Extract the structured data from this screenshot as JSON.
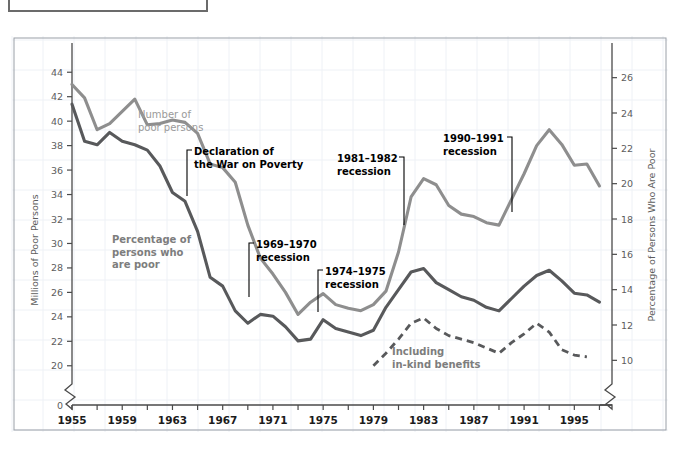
{
  "figure": {
    "cut_off_box_label": "",
    "background_color": "#ffffff",
    "grid_color": "#eef1f6",
    "frame_color": "#9aa0a8"
  },
  "axes": {
    "left": {
      "title": "Millions of Poor Persons",
      "tick_labels": [
        "0",
        "20",
        "22",
        "24",
        "26",
        "28",
        "30",
        "32",
        "34",
        "36",
        "38",
        "40",
        "42",
        "44"
      ],
      "has_break": true,
      "break_symbol": "zigzag"
    },
    "right": {
      "title": "Percentage of Persons Who Are Poor",
      "tick_labels": [
        "10",
        "12",
        "14",
        "16",
        "18",
        "20",
        "22",
        "24",
        "26"
      ],
      "has_break": true,
      "break_symbol": "zigzag"
    },
    "bottom": {
      "tick_labels": [
        "1955",
        "1959",
        "1963",
        "1967",
        "1971",
        "1975",
        "1979",
        "1983",
        "1987",
        "1991",
        "1995"
      ],
      "minor_tick_step_years": 2
    }
  },
  "annotations": [
    {
      "id": "number-of-poor-persons",
      "text_lines": [
        "Number of",
        "poor persons"
      ],
      "style": "gray-light",
      "has_leader": false
    },
    {
      "id": "percentage-who-are-poor",
      "text_lines": [
        "Percentage of",
        "persons who",
        "are poor"
      ],
      "style": "gray-dark",
      "has_leader": false
    },
    {
      "id": "declaration-war-on-poverty",
      "text_lines": [
        "Declaration of",
        "the War on Poverty"
      ],
      "style": "bold",
      "has_leader": true,
      "leader_side": "left"
    },
    {
      "id": "recession-1969-1970",
      "text_lines": [
        "1969–1970",
        "recession"
      ],
      "style": "bold",
      "has_leader": true,
      "leader_side": "left"
    },
    {
      "id": "recession-1974-1975",
      "text_lines": [
        "1974–1975",
        "recession"
      ],
      "style": "bold",
      "has_leader": true,
      "leader_side": "left"
    },
    {
      "id": "recession-1981-1982",
      "text_lines": [
        "1981–1982",
        "recession"
      ],
      "style": "bold",
      "has_leader": true,
      "leader_side": "right"
    },
    {
      "id": "recession-1990-1991",
      "text_lines": [
        "1990–1991",
        "recession"
      ],
      "style": "bold",
      "has_leader": true,
      "leader_side": "right"
    },
    {
      "id": "including-in-kind-benefits",
      "text_lines": [
        "Including",
        "in-kind benefits"
      ],
      "style": "inkind",
      "has_leader": false
    }
  ],
  "chart_data": {
    "type": "line",
    "title": "",
    "subtitle": "",
    "xlabel": "",
    "ylabel": "Millions of Poor Persons",
    "y2label": "Percentage of Persons Who Are Poor",
    "grid": true,
    "legend": "inline-annotations",
    "xlim": [
      1955,
      1998
    ],
    "ylim": [
      19.0,
      45.0
    ],
    "y2lim": [
      9.0,
      27.0
    ],
    "x": [
      1955,
      1956,
      1957,
      1958,
      1959,
      1960,
      1961,
      1962,
      1963,
      1964,
      1965,
      1966,
      1967,
      1968,
      1969,
      1970,
      1971,
      1972,
      1973,
      1974,
      1975,
      1976,
      1977,
      1978,
      1979,
      1980,
      1981,
      1982,
      1983,
      1984,
      1985,
      1986,
      1987,
      1988,
      1989,
      1990,
      1991,
      1992,
      1993,
      1994,
      1995,
      1996,
      1997
    ],
    "series": [
      {
        "name": "Number of poor persons",
        "unit": "millions",
        "axis": "left",
        "color": "#8e8e8e",
        "style": "solid",
        "values": [
          43.0,
          41.9,
          39.3,
          39.8,
          40.8,
          41.8,
          39.7,
          39.8,
          40.1,
          39.9,
          39.0,
          36.5,
          36.2,
          35.0,
          31.5,
          28.8,
          27.5,
          26.0,
          24.2,
          25.2,
          25.9,
          25.0,
          24.7,
          24.5,
          25.0,
          26.1,
          29.3,
          33.8,
          35.3,
          34.8,
          33.1,
          32.4,
          32.2,
          31.7,
          31.5,
          33.6,
          35.7,
          38.0,
          39.3,
          38.1,
          36.4,
          36.5,
          34.7
        ]
      },
      {
        "name": "Percentage of persons who are poor",
        "unit": "percent",
        "axis": "right",
        "color": "#58595b",
        "style": "solid",
        "values": [
          24.5,
          22.4,
          22.2,
          22.9,
          22.4,
          22.2,
          21.9,
          21.0,
          19.5,
          19.0,
          17.3,
          14.7,
          14.2,
          12.8,
          12.1,
          12.6,
          12.5,
          11.9,
          11.1,
          11.2,
          12.3,
          11.8,
          11.6,
          11.4,
          11.7,
          13.0,
          14.0,
          15.0,
          15.2,
          14.4,
          14.0,
          13.6,
          13.4,
          13.0,
          12.8,
          13.5,
          14.2,
          14.8,
          15.1,
          14.5,
          13.8,
          13.7,
          13.3
        ]
      },
      {
        "name": "Including in-kind benefits",
        "unit": "percent",
        "axis": "right",
        "color": "#58595b",
        "style": "dashed",
        "x": [
          1979,
          1980,
          1981,
          1982,
          1983,
          1984,
          1985,
          1986,
          1987,
          1988,
          1989,
          1990,
          1991,
          1992,
          1993,
          1994,
          1995,
          1996
        ],
        "values": [
          9.7,
          10.4,
          11.2,
          12.1,
          12.4,
          11.8,
          11.4,
          11.2,
          11.0,
          10.7,
          10.4,
          11.0,
          11.5,
          12.1,
          11.6,
          10.6,
          10.3,
          10.2
        ]
      }
    ],
    "annotation_points": [
      {
        "label": "Declaration of the War on Poverty",
        "x": 1964
      },
      {
        "label": "1969–1970 recession",
        "x": 1970
      },
      {
        "label": "1974–1975 recession",
        "x": 1975
      },
      {
        "label": "1981–1982 recession",
        "x": 1982
      },
      {
        "label": "1990–1991 recession",
        "x": 1991
      }
    ]
  }
}
